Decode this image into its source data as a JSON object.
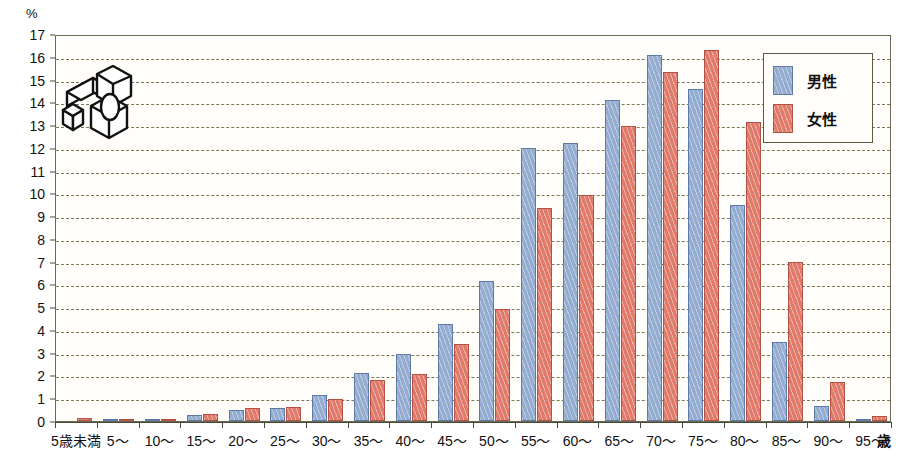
{
  "chart_data": {
    "type": "bar",
    "title": "",
    "xlabel": "歳",
    "ylabel": "%",
    "y_unit": "%",
    "x_unit": "歳",
    "ylim": [
      0,
      17
    ],
    "ytick_step": 1,
    "grid": true,
    "legend_position": "top-right",
    "categories": [
      "5歳未満",
      "5〜",
      "10〜",
      "15〜",
      "20〜",
      "25〜",
      "30〜",
      "35〜",
      "40〜",
      "45〜",
      "50〜",
      "55〜",
      "60〜",
      "65〜",
      "70〜",
      "75〜",
      "80〜",
      "85〜",
      "90〜",
      "95〜"
    ],
    "ytick_labels": [
      "0",
      "1",
      "2",
      "3",
      "4",
      "5",
      "6",
      "7",
      "8",
      "9",
      "10",
      "11",
      "12",
      "13",
      "14",
      "15",
      "16",
      "17"
    ],
    "series": [
      {
        "name": "男性",
        "color": "#93acd0",
        "border_color": "#5d7ba6",
        "values": [
          0.0,
          0.1,
          0.1,
          0.25,
          0.5,
          0.55,
          1.15,
          2.1,
          2.95,
          4.25,
          6.15,
          12.0,
          12.2,
          14.1,
          16.1,
          14.6,
          9.5,
          3.45,
          0.65,
          0.08
        ]
      },
      {
        "name": "女性",
        "color": "#e07b6b",
        "border_color": "#b35244",
        "values": [
          0.15,
          0.05,
          0.1,
          0.3,
          0.55,
          0.6,
          0.95,
          1.8,
          2.05,
          3.4,
          4.9,
          9.35,
          9.95,
          12.95,
          15.35,
          16.3,
          13.15,
          7.0,
          1.7,
          0.2
        ]
      }
    ]
  },
  "legend": {
    "items": [
      {
        "label": "男性",
        "swatch": "male"
      },
      {
        "label": "女性",
        "swatch": "female"
      }
    ]
  },
  "axes": {
    "y_unit_label": "%",
    "x_unit_label": "歳"
  },
  "colors": {
    "male": "#93acd0",
    "female": "#e07b6b",
    "grid": "#7a7a58",
    "axis": "#4a4a3a",
    "plot_background": "#fffefa"
  }
}
